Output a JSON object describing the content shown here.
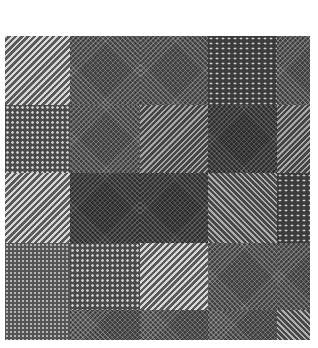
{
  "image": {
    "description": "Grayscale collage of natural textures arranged in a grid of square patches",
    "grid": {
      "rows": 5,
      "cols": 5
    },
    "tiles": [
      [
        "diagonal-stripes-light",
        "weave",
        "weave",
        "dotted-grid",
        "weave"
      ],
      [
        "dotted-grid",
        "weave",
        "diagonal-stripes-mid",
        "weave-dark",
        "diagonal-stripes-mid"
      ],
      [
        "diagonal-stripes-light",
        "weave-dark",
        "weave-dark",
        "diagonal-stripes-rev",
        "dotted-grid"
      ],
      [
        "fine-dots",
        "dotted-grid",
        "diagonal-stripes-light",
        "weave",
        "weave"
      ],
      [
        "fine-dots",
        "weave",
        "weave",
        "weave",
        "diagonal-stripes-rev"
      ]
    ],
    "background_color": "#ffffff"
  }
}
